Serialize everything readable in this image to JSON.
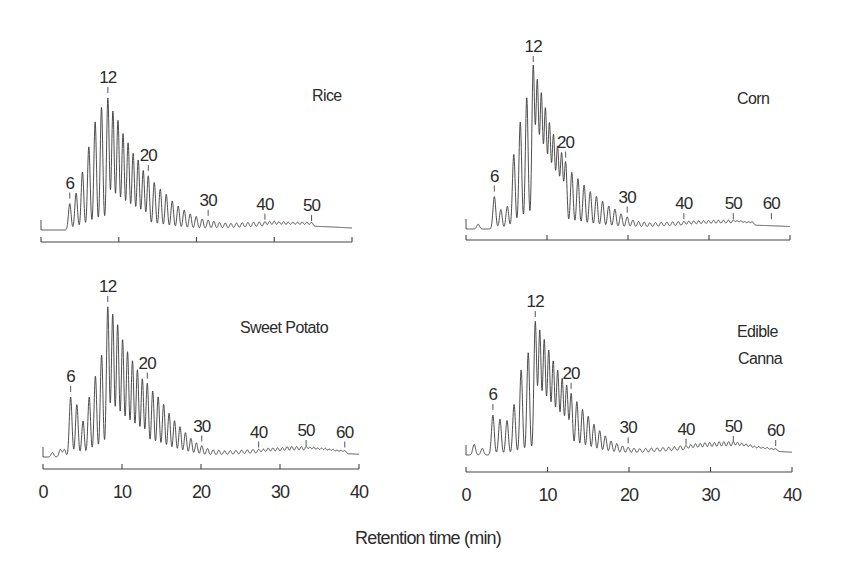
{
  "chart_data": {
    "type": "line",
    "title": "",
    "xlabel": "Retention time (min)",
    "ylabel": "",
    "xlim": [
      0,
      40
    ],
    "x_ticks": [
      0,
      10,
      20,
      30,
      40
    ],
    "grid": false,
    "legend": "none",
    "y_units": "relative detector response (DP12 = 100)",
    "panels": [
      {
        "id": "rice",
        "label": [
          "Rice"
        ],
        "dp_markers": [
          6,
          12,
          20,
          30,
          40,
          50
        ],
        "dp_time_anchors": {
          "1": 0.5,
          "6": 3.7,
          "12": 8.6,
          "20": 13.8,
          "30": 21.5,
          "40": 28.8,
          "50": 34.8,
          "60": 39.5
        },
        "peaks_dp": [
          6,
          7,
          8,
          9,
          10,
          11,
          12,
          13,
          14,
          15,
          16,
          17,
          18,
          19,
          20,
          21,
          22,
          23,
          24,
          25,
          26,
          27,
          28,
          29,
          30,
          31,
          32,
          33,
          34,
          35,
          36,
          37,
          38,
          39,
          40,
          41,
          42,
          43,
          44,
          45,
          46,
          47,
          48,
          49,
          50
        ],
        "peak_heights": [
          20,
          28,
          44,
          63,
          82,
          93,
          100,
          90,
          83,
          73,
          66,
          58,
          53,
          45,
          41,
          36,
          31,
          27,
          22,
          18,
          15,
          12,
          10,
          8,
          7,
          6,
          5,
          4.5,
          4,
          4,
          4,
          4,
          4,
          4,
          4,
          4,
          4,
          3.5,
          3.5,
          3,
          3,
          3,
          3,
          3,
          3
        ],
        "pre_peaks": [
          [
            0,
            0
          ]
        ],
        "hump": {
          "center": 33,
          "width": 6,
          "height": 3
        },
        "show_tick_labels": false
      },
      {
        "id": "corn",
        "label": [
          "Corn"
        ],
        "dp_markers": [
          6,
          12,
          20,
          30,
          40,
          50,
          60
        ],
        "dp_time_anchors": {
          "1": 0.5,
          "6": 3.5,
          "12": 8.3,
          "20": 12.3,
          "30": 19.9,
          "40": 26.9,
          "50": 33.0,
          "60": 37.7
        },
        "peaks_dp": [
          6,
          7,
          8,
          9,
          10,
          11,
          12,
          13,
          14,
          15,
          16,
          17,
          18,
          19,
          20,
          21,
          22,
          23,
          24,
          25,
          26,
          27,
          28,
          29,
          30,
          31,
          32,
          33,
          34,
          35,
          36,
          37,
          38,
          39,
          40,
          41,
          42,
          43,
          44,
          45,
          46,
          47,
          48,
          49,
          50,
          51,
          52,
          53,
          54,
          55
        ],
        "peak_heights": [
          20,
          12,
          14,
          46,
          66,
          81,
          100,
          90,
          82,
          73,
          64,
          57,
          50,
          46,
          41,
          35,
          31,
          27,
          23,
          20,
          17,
          14,
          12,
          9,
          7,
          5,
          4,
          3.5,
          3,
          3,
          3,
          3,
          3,
          3,
          3,
          3,
          3,
          3,
          3,
          3,
          3,
          3,
          3,
          3,
          3,
          2.5,
          2.5,
          2,
          2,
          2
        ],
        "pre_peaks": [
          [
            1.5,
            3
          ]
        ],
        "hump": {
          "center": 33,
          "width": 7,
          "height": 2.5
        },
        "show_tick_labels": false
      },
      {
        "id": "sweet-potato",
        "label": [
          "Sweet Potato"
        ],
        "dp_markers": [
          6,
          12,
          20,
          30,
          40,
          50,
          60
        ],
        "dp_time_anchors": {
          "1": 0.5,
          "6": 3.5,
          "12": 8.2,
          "20": 13.2,
          "30": 20.1,
          "40": 27.3,
          "50": 33.3,
          "60": 38.2
        },
        "peaks_dp": [
          6,
          7,
          8,
          9,
          10,
          11,
          12,
          13,
          14,
          15,
          16,
          17,
          18,
          19,
          20,
          21,
          22,
          23,
          24,
          25,
          26,
          27,
          28,
          29,
          30,
          31,
          32,
          33,
          34,
          35,
          36,
          37,
          38,
          39,
          40,
          41,
          42,
          43,
          44,
          45,
          46,
          47,
          48,
          49,
          50,
          51,
          52,
          53,
          54,
          55,
          56,
          57,
          58,
          59,
          60
        ],
        "peak_heights": [
          40,
          35,
          24,
          40,
          54,
          68,
          100,
          95,
          88,
          78,
          70,
          64,
          58,
          52,
          49,
          44,
          40,
          35,
          29,
          24,
          20,
          16,
          12,
          9,
          7,
          5,
          4,
          3.5,
          3,
          3,
          3,
          3,
          3,
          3,
          3,
          3,
          3.5,
          3.5,
          3.5,
          3.5,
          4,
          4,
          4,
          4,
          4,
          3.5,
          3.5,
          3,
          3,
          3,
          2.5,
          2.5,
          2,
          2,
          2
        ],
        "pre_peaks": [
          [
            1.2,
            3
          ],
          [
            2.2,
            5
          ],
          [
            2.7,
            5
          ]
        ],
        "hump": {
          "center": 33,
          "width": 7,
          "height": 3
        },
        "show_tick_labels": true
      },
      {
        "id": "edible-canna",
        "label": [
          "Edible",
          "Canna"
        ],
        "dp_markers": [
          6,
          12,
          20,
          30,
          40,
          50,
          60
        ],
        "dp_time_anchors": {
          "1": 0.5,
          "6": 3.3,
          "12": 8.5,
          "20": 12.9,
          "30": 19.9,
          "40": 27.0,
          "50": 32.8,
          "60": 38.0
        },
        "peaks_dp": [
          6,
          7,
          8,
          9,
          10,
          11,
          12,
          13,
          14,
          15,
          16,
          17,
          18,
          19,
          20,
          21,
          22,
          23,
          24,
          25,
          26,
          27,
          28,
          29,
          30,
          31,
          32,
          33,
          34,
          35,
          36,
          37,
          38,
          39,
          40,
          41,
          42,
          43,
          44,
          45,
          46,
          47,
          48,
          49,
          50,
          51,
          52,
          53,
          54,
          55,
          56,
          57,
          58,
          59,
          60
        ],
        "peak_heights": [
          30,
          27,
          26,
          38,
          64,
          77,
          100,
          93,
          86,
          78,
          70,
          63,
          57,
          52,
          46,
          40,
          34,
          29,
          23,
          18,
          14,
          10,
          8,
          6,
          5,
          4,
          3.5,
          3.5,
          3.5,
          3.5,
          3.5,
          3.5,
          3.5,
          4,
          4,
          4.5,
          5,
          5,
          5.5,
          5.5,
          5.5,
          6,
          6,
          6,
          6,
          5.5,
          5,
          4.5,
          4,
          3,
          3,
          2.5,
          2.5,
          2,
          2
        ],
        "pre_peaks": [
          [
            1.0,
            8
          ],
          [
            2.0,
            5
          ]
        ],
        "hump": {
          "center": 32,
          "width": 7,
          "height": 4
        },
        "show_tick_labels": true
      }
    ]
  },
  "figure": {
    "xlabel": "Retention time (min)",
    "tick_labels": [
      "0",
      "10",
      "20",
      "30",
      "40"
    ]
  }
}
